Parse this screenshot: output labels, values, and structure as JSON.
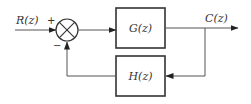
{
  "diagram": {
    "type": "feedback-control-block-diagram",
    "input_label": "R(z)",
    "output_label": "C(z)",
    "summing_junction": {
      "plus_sign": "+",
      "minus_sign": "−"
    },
    "forward_block": {
      "label": "G(z)"
    },
    "feedback_block": {
      "label": "H(z)"
    }
  }
}
